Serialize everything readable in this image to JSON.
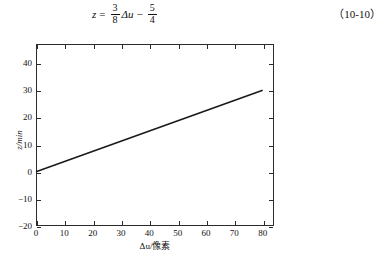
{
  "equation": {
    "lhs": "z",
    "equals": "=",
    "term1_numerator": "3",
    "term1_denominator": "8",
    "variable": "Δu",
    "minus": "−",
    "term2_numerator": "5",
    "term2_denominator": "4",
    "number": "（10-10）"
  },
  "chart_data": {
    "type": "line",
    "title": "",
    "xlabel": "Δu/像素",
    "ylabel": "z/min",
    "xlim": [
      0,
      84
    ],
    "ylim": [
      -20,
      47
    ],
    "xticks": [
      "0",
      "10",
      "20",
      "30",
      "40",
      "50",
      "60",
      "70",
      "80"
    ],
    "xtick_values": [
      0,
      10,
      20,
      30,
      40,
      50,
      60,
      70,
      80
    ],
    "yticks": [
      "40",
      "30",
      "20",
      "10",
      "0",
      "−10",
      "−20"
    ],
    "ytick_values": [
      40,
      30,
      20,
      10,
      0,
      -10,
      -20
    ],
    "grid": false,
    "legend": "none",
    "series": [
      {
        "name": "z vs Δu",
        "color": "#1a1a1a",
        "x": [
          0,
          80
        ],
        "y": [
          0,
          30
        ]
      }
    ]
  }
}
